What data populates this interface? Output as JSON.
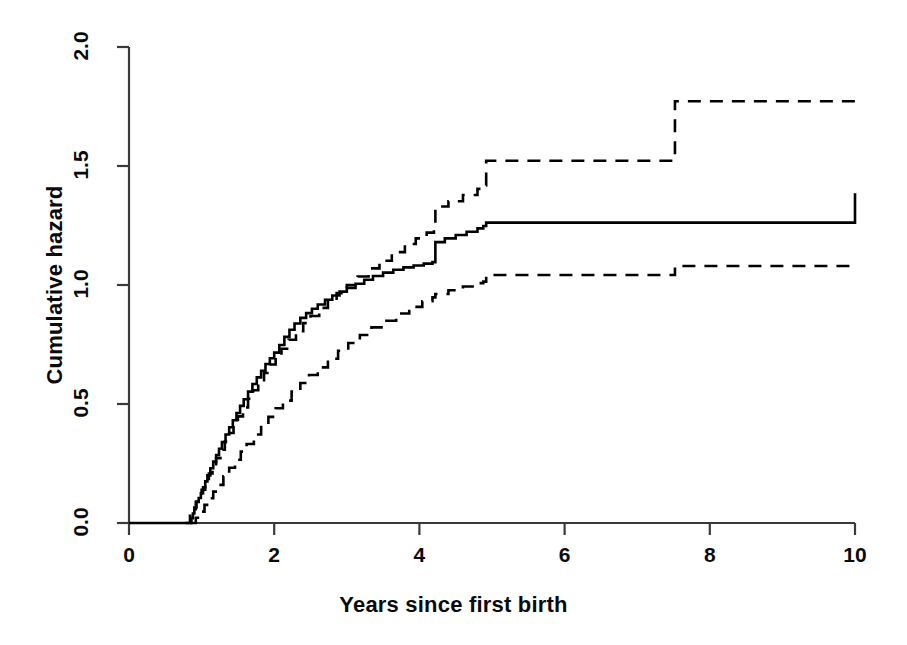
{
  "chart_data": {
    "type": "line",
    "title": "",
    "xlabel": "Years since first birth",
    "ylabel": "Cumulative hazard",
    "xlim": [
      0,
      10
    ],
    "ylim": [
      0,
      2.0
    ],
    "xticks": [
      "0",
      "2",
      "4",
      "6",
      "8",
      "10"
    ],
    "xtick_values": [
      0,
      2,
      4,
      6,
      8,
      10
    ],
    "yticks": [
      "0.0",
      "0.5",
      "1.0",
      "1.5",
      "2.0"
    ],
    "ytick_values": [
      0.0,
      0.5,
      1.0,
      1.5,
      2.0
    ],
    "grid": false,
    "legend": null,
    "style": "step",
    "series": [
      {
        "name": "Cumulative hazard estimate",
        "line_style": "solid",
        "line_width": 2.6,
        "color": "#000000",
        "x": [
          0.0,
          0.82,
          0.86,
          0.88,
          0.9,
          0.93,
          0.96,
          0.99,
          1.02,
          1.05,
          1.08,
          1.12,
          1.16,
          1.2,
          1.24,
          1.28,
          1.33,
          1.38,
          1.43,
          1.48,
          1.53,
          1.58,
          1.64,
          1.7,
          1.76,
          1.82,
          1.88,
          1.94,
          2.0,
          2.07,
          2.14,
          2.21,
          2.28,
          2.36,
          2.44,
          2.52,
          2.6,
          2.7,
          2.8,
          2.9,
          3.0,
          3.12,
          3.24,
          3.36,
          3.5,
          3.64,
          3.78,
          3.92,
          4.06,
          4.18,
          4.22,
          4.35,
          4.5,
          4.65,
          4.8,
          4.88,
          4.92,
          7.5,
          10.0
        ],
        "y": [
          0.0,
          0.0,
          0.02,
          0.04,
          0.065,
          0.09,
          0.105,
          0.125,
          0.15,
          0.175,
          0.2,
          0.23,
          0.258,
          0.285,
          0.312,
          0.34,
          0.372,
          0.402,
          0.432,
          0.462,
          0.492,
          0.52,
          0.552,
          0.584,
          0.612,
          0.64,
          0.668,
          0.692,
          0.716,
          0.748,
          0.782,
          0.812,
          0.838,
          0.862,
          0.882,
          0.9,
          0.918,
          0.938,
          0.956,
          0.972,
          0.988,
          1.005,
          1.022,
          1.038,
          1.052,
          1.064,
          1.074,
          1.082,
          1.09,
          1.096,
          1.18,
          1.196,
          1.21,
          1.224,
          1.238,
          1.248,
          1.262,
          1.262,
          1.385
        ]
      },
      {
        "name": "Upper 95% confidence limit",
        "line_style": "dashed",
        "line_width": 2.6,
        "color": "#000000",
        "x": [
          0.78,
          0.84,
          0.88,
          0.92,
          0.96,
          1.0,
          1.05,
          1.1,
          1.15,
          1.2,
          1.26,
          1.32,
          1.38,
          1.44,
          1.5,
          1.57,
          1.64,
          1.71,
          1.78,
          1.86,
          1.94,
          2.02,
          2.1,
          2.2,
          2.3,
          2.4,
          2.5,
          2.62,
          2.74,
          2.86,
          3.0,
          3.15,
          3.3,
          3.45,
          3.62,
          3.8,
          3.95,
          4.1,
          4.2,
          4.22,
          4.4,
          4.6,
          4.8,
          4.88,
          4.92,
          7.5,
          7.52,
          10.0
        ],
        "y": [
          0.0,
          0.03,
          0.058,
          0.088,
          0.112,
          0.14,
          0.175,
          0.208,
          0.24,
          0.272,
          0.308,
          0.342,
          0.378,
          0.412,
          0.448,
          0.486,
          0.522,
          0.558,
          0.592,
          0.63,
          0.666,
          0.7,
          0.732,
          0.77,
          0.806,
          0.84,
          0.87,
          0.904,
          0.936,
          0.966,
          1.0,
          1.036,
          1.07,
          1.102,
          1.138,
          1.172,
          1.196,
          1.22,
          1.236,
          1.33,
          1.352,
          1.378,
          1.404,
          1.418,
          1.522,
          1.522,
          1.772,
          1.772
        ]
      },
      {
        "name": "Lower 95% confidence limit",
        "line_style": "dashed",
        "line_width": 2.6,
        "color": "#000000",
        "x": [
          0.86,
          0.92,
          0.98,
          1.04,
          1.1,
          1.16,
          1.22,
          1.3,
          1.38,
          1.46,
          1.54,
          1.62,
          1.72,
          1.82,
          1.92,
          2.02,
          2.12,
          2.24,
          2.36,
          2.48,
          2.6,
          2.74,
          2.88,
          3.02,
          3.18,
          3.34,
          3.5,
          3.68,
          3.86,
          4.04,
          4.18,
          4.22,
          4.4,
          4.6,
          4.8,
          4.88,
          4.92,
          7.5,
          7.52,
          10.0
        ],
        "y": [
          0.0,
          0.022,
          0.048,
          0.076,
          0.104,
          0.132,
          0.16,
          0.196,
          0.232,
          0.266,
          0.3,
          0.332,
          0.372,
          0.41,
          0.446,
          0.482,
          0.514,
          0.552,
          0.588,
          0.622,
          0.654,
          0.69,
          0.724,
          0.756,
          0.79,
          0.822,
          0.85,
          0.88,
          0.908,
          0.932,
          0.948,
          0.962,
          0.978,
          0.994,
          1.008,
          1.014,
          1.042,
          1.042,
          1.08,
          1.08
        ]
      }
    ]
  },
  "axes": {
    "xlabel": "Years since first birth",
    "ylabel": "Cumulative hazard"
  }
}
